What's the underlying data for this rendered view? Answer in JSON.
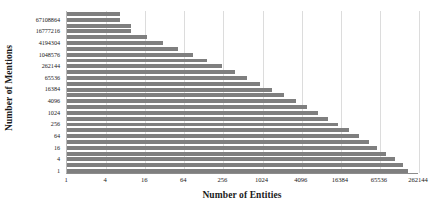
{
  "chart_data": {
    "type": "bar",
    "orientation": "horizontal",
    "title": "",
    "xlabel": "Number of Entities",
    "ylabel": "Number of Mentions",
    "xscale": "log",
    "yscale": "log",
    "xlim": [
      1,
      262144
    ],
    "grid": true,
    "legend": null,
    "bar_color": "#7f7f7f",
    "xticks": [
      1,
      4,
      16,
      64,
      256,
      1024,
      4096,
      16384,
      65536,
      262144
    ],
    "xtick_labels": [
      "1",
      "4",
      "16",
      "64",
      "256",
      "1024",
      "4096",
      "16384",
      "65536",
      "262144"
    ],
    "yticks": [
      1,
      4,
      16,
      64,
      256,
      1024,
      4096,
      16384,
      65536,
      262144,
      1048576,
      4194304,
      16777216,
      67108864
    ],
    "ytick_labels": [
      "1",
      "4",
      "16",
      "64",
      "256",
      "1024",
      "4096",
      "16384",
      "65536",
      "262144",
      "1048576",
      "4194304",
      "16777216",
      "67108864"
    ],
    "categories": [
      1,
      2,
      4,
      8,
      16,
      32,
      64,
      128,
      256,
      512,
      1024,
      2048,
      4096,
      8192,
      16384,
      32768,
      65536,
      131072,
      262144,
      524288,
      1048576,
      2097152,
      4194304,
      8388608,
      16777216,
      33554432,
      67108864,
      134217728
    ],
    "values": [
      180000,
      150000,
      110000,
      82000,
      60000,
      44000,
      31000,
      22000,
      15000,
      10500,
      7200,
      4900,
      3300,
      2200,
      1450,
      950,
      600,
      380,
      240,
      145,
      88,
      52,
      30,
      17,
      9.5,
      9.5,
      6.5,
      6.5
    ],
    "series": [
      {
        "name": "Entities per mention count",
        "values": [
          180000,
          150000,
          110000,
          82000,
          60000,
          44000,
          31000,
          22000,
          15000,
          10500,
          7200,
          4900,
          3300,
          2200,
          1450,
          950,
          600,
          380,
          240,
          145,
          88,
          52,
          30,
          17,
          9.5,
          9.5,
          6.5,
          6.5
        ]
      }
    ]
  }
}
